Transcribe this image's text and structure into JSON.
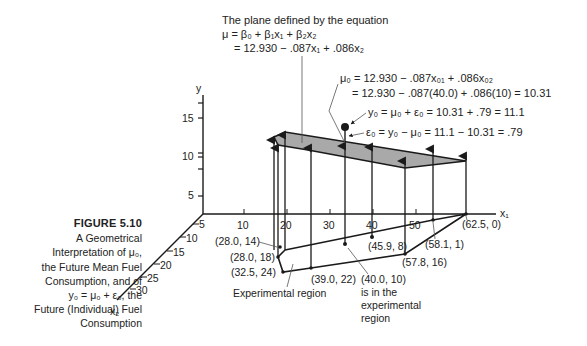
{
  "caption": {
    "figure_label": "FIGURE 5.10",
    "lines": [
      "A Geometrical",
      "Interpretation of μ₀,",
      "the Future Mean Fuel",
      "Consumption, and of",
      "y₀ = μ₀ + ε₀, the",
      "Future (Individual) Fuel",
      "Consumption"
    ]
  },
  "plane_annotation": {
    "line1": "The plane defined by the equation",
    "line2": "μ = β₀ + β₁x₁ + β₂x₂",
    "line3": "= 12.930 − .087x₁ + .086x₂"
  },
  "mu0_annotation": {
    "line1": "μ₀ = 12.930 − .087x₀₁ + .086x₀₂",
    "line2": "= 12.930 − .087(40.0) + .086(10) = 10.31"
  },
  "y0_annotation": "y₀ = μ₀ + ε₀ = 10.31 + .79 = 11.1",
  "e0_annotation": "ε₀ = y₀ − μ₀ = 11.1 − 10.31 = .79",
  "axes": {
    "y_label": "y",
    "x1_label": "x₁",
    "x2_label": "x₂",
    "y_ticks": [
      "5",
      "10",
      "15"
    ],
    "x1_ticks": [
      "10",
      "20",
      "30",
      "40",
      "50"
    ],
    "x2_ticks": [
      "5",
      "10",
      "15",
      "20",
      "25",
      "30"
    ]
  },
  "points": [
    {
      "label": "(28.0, 14)"
    },
    {
      "label": "(28.0, 18)"
    },
    {
      "label": "(32.5, 24)"
    },
    {
      "label": "(39.0, 22)"
    },
    {
      "label": "(45.9, 8)"
    },
    {
      "label": "(57.8, 16)"
    },
    {
      "label": "(58.1, 1)"
    },
    {
      "label": "(62.5, 0)"
    }
  ],
  "new_point_label": [
    "(40.0, 10)",
    "is in the",
    "experimental",
    "region"
  ],
  "region_label": "Experimental region",
  "colors": {
    "plane_fill": "#a9a9a9",
    "ink": "#1a1a1a"
  }
}
